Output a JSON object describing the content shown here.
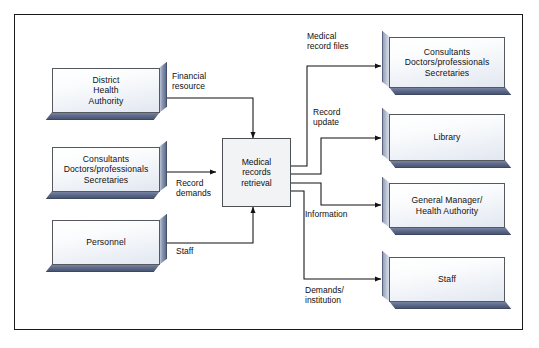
{
  "diagram": {
    "type": "data-flow-diagram",
    "frame": {
      "border_color": "#1a1a1a",
      "background": "#ffffff"
    },
    "colors": {
      "box_fill_top": "#ffffff",
      "box_fill_bottom": "#e2e7f0",
      "box_border": "#55585c",
      "extrusion_shadow": "#5b6788",
      "process_fill": "#f2f3f5",
      "connector": "#1a1a1a",
      "text": "#111111"
    },
    "entities_left": [
      {
        "id": "district-health-authority",
        "label": "District\nHealth\nAuthority"
      },
      {
        "id": "consultants-left",
        "label": "Consultants\nDoctors/professionals\nSecretaries"
      },
      {
        "id": "personnel",
        "label": "Personnel"
      }
    ],
    "process": {
      "id": "medical-records-retrieval",
      "label": "Medical\nrecords\nretrieval"
    },
    "entities_right": [
      {
        "id": "consultants-right",
        "label": "Consultants\nDoctors/professionals\nSecretaries"
      },
      {
        "id": "library",
        "label": "Library"
      },
      {
        "id": "general-manager",
        "label": "General Manager/\nHealth Authority"
      },
      {
        "id": "staff-right",
        "label": "Staff"
      }
    ],
    "flows_in": [
      {
        "id": "financial-resource",
        "label": "Financial\nresource",
        "from": "district-health-authority",
        "to": "medical-records-retrieval"
      },
      {
        "id": "record-demands",
        "label": "Record\ndemands",
        "from": "consultants-left",
        "to": "medical-records-retrieval"
      },
      {
        "id": "staff",
        "label": "Staff",
        "from": "personnel",
        "to": "medical-records-retrieval"
      }
    ],
    "flows_out": [
      {
        "id": "medical-record-files",
        "label": "Medical\nrecord files",
        "from": "medical-records-retrieval",
        "to": "consultants-right"
      },
      {
        "id": "record-update",
        "label": "Record\nupdate",
        "from": "medical-records-retrieval",
        "to": "library"
      },
      {
        "id": "information",
        "label": "Information",
        "from": "medical-records-retrieval",
        "to": "general-manager"
      },
      {
        "id": "demands-institution",
        "label": "Demands/\ninstitution",
        "from": "medical-records-retrieval",
        "to": "staff-right"
      }
    ]
  }
}
